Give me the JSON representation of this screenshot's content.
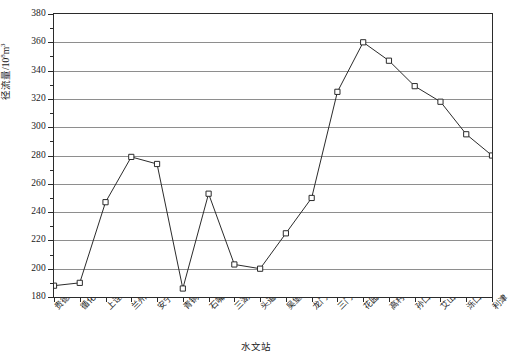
{
  "chart_data": {
    "type": "line",
    "title": "",
    "xlabel": "水文站",
    "ylabel_prefix": "径流量/10",
    "ylabel_sup": "8",
    "ylabel_suffix": "m",
    "ylabel_suffix_sup": "3",
    "ylabel_full": "径流量/10⁸m³",
    "categories": [
      "贵德",
      "循化",
      "上诠",
      "兰州",
      "安宁渡",
      "青铜峡",
      "石嘴山",
      "三湖河口",
      "头道拐",
      "吴堡",
      "龙门",
      "三门峡",
      "花园口",
      "高村",
      "孙口",
      "艾山",
      "泺口",
      "利津"
    ],
    "values": [
      188,
      190,
      247,
      279,
      274,
      186,
      253,
      203,
      200,
      225,
      250,
      325,
      360,
      347,
      329,
      318,
      295,
      280
    ],
    "ylim": [
      180,
      380
    ],
    "yticks": [
      180,
      200,
      220,
      240,
      260,
      280,
      300,
      320,
      340,
      360,
      380
    ],
    "ytick_labels": [
      "180",
      "200",
      "220",
      "240",
      "260",
      "280",
      "300",
      "320",
      "340",
      "360",
      "380"
    ],
    "y_minor_step": 10,
    "grid": "horizontal",
    "legend": "none",
    "marker": "open-square",
    "line_color": "#2b2b2b",
    "grid_color": "#8e8e8e",
    "axis_color": "#2b2b2b",
    "background": "#ffffff"
  }
}
